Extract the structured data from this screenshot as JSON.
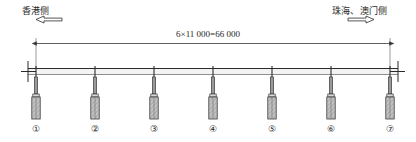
{
  "drawing": {
    "type": "bridge-elevation",
    "title_text": "",
    "background_color": "#ffffff",
    "line_color": "#2b2b2b",
    "hatch_color": "#8a8a8a",
    "fill_color": "#b8b8b8"
  },
  "labels": {
    "left_side": {
      "text": "香港侧",
      "arrow": "left-arrow-outline"
    },
    "right_side": {
      "text": "珠海、澳门侧",
      "arrow": "right-arrow-outline"
    }
  },
  "dimension": {
    "text": "6×11 000=66 000",
    "span_count": 6,
    "span_length": "11 000",
    "total_length": "66 000",
    "start_x": 36,
    "end_x": 390
  },
  "piers": [
    {
      "label": "①",
      "x": 36
    },
    {
      "label": "②",
      "x": 95
    },
    {
      "label": "③",
      "x": 154
    },
    {
      "label": "④",
      "x": 213
    },
    {
      "label": "⑤",
      "x": 272
    },
    {
      "label": "⑥",
      "x": 331
    },
    {
      "label": "⑦",
      "x": 390
    }
  ],
  "deck": {
    "top_y": 68,
    "bottom_y": 75,
    "left_x": 28,
    "right_x": 398
  }
}
